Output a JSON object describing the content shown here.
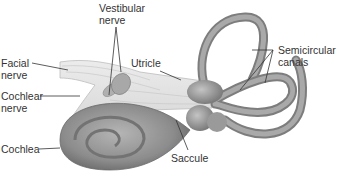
{
  "diagram": {
    "colors": {
      "background": "#ffffff",
      "structure": "#9a9a9a",
      "structure_dark": "#6f6f6f",
      "structure_light": "#d2d2d2",
      "nerve": "#e2e2e2",
      "leader_line": "#333333",
      "text": "#333333"
    },
    "labels": [
      {
        "id": "vestibular-nerve",
        "lines": [
          "Vestibular",
          "nerve"
        ]
      },
      {
        "id": "facial-nerve",
        "lines": [
          "Facial",
          "nerve"
        ]
      },
      {
        "id": "utricle",
        "lines": [
          "Utricle"
        ]
      },
      {
        "id": "semicircular-canals",
        "lines": [
          "Semicircular",
          "canals"
        ]
      },
      {
        "id": "cochlear-nerve",
        "lines": [
          "Cochlear",
          "nerve"
        ]
      },
      {
        "id": "cochlea",
        "lines": [
          "Cochlea"
        ]
      },
      {
        "id": "saccule",
        "lines": [
          "Saccule"
        ]
      }
    ]
  }
}
